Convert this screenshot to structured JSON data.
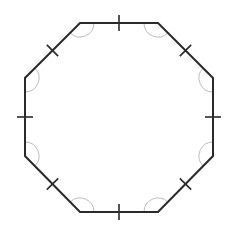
{
  "diagram": {
    "shape": "regular-octagon",
    "colors": {
      "stroke": "#2a2a2a",
      "arc": "#bdbdbd",
      "background": "#ffffff"
    },
    "vertices": [
      [
        80,
        23
      ],
      [
        158,
        23
      ],
      [
        213,
        78
      ],
      [
        213,
        156
      ],
      [
        158,
        212
      ],
      [
        80,
        212
      ],
      [
        25,
        156
      ],
      [
        25,
        78
      ]
    ],
    "side_marks": 8,
    "angle_arcs": 8
  }
}
